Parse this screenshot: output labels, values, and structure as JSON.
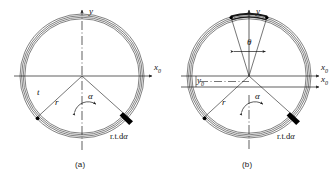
{
  "figure": {
    "type": "engineering-diagram",
    "panels": [
      {
        "id": "a",
        "caption": "(a)",
        "center": {
          "x": 82,
          "y": 76
        },
        "radius": 62,
        "wall_lines": 4,
        "wall_gap": 1.6,
        "labels": {
          "y_axis": "y",
          "x_axis": "x",
          "x_axis_sub": "0",
          "thickness": "t",
          "radius": "r",
          "angle_alpha": "α",
          "element": "r.t.d",
          "element_italic": "α"
        },
        "radial_lines": [
          {
            "angle_deg": 222,
            "name": "radius-line-left"
          },
          {
            "angle_deg": 318,
            "name": "radius-line-right"
          }
        ],
        "markers": [
          {
            "angle_deg": 222,
            "kind": "dot"
          },
          {
            "angle_deg": 318,
            "kind": "wedge"
          }
        ]
      },
      {
        "id": "b",
        "caption": "(b)",
        "center": {
          "x": 249,
          "y": 76
        },
        "radius": 62,
        "wall_lines": 4,
        "wall_gap": 1.6,
        "labels": {
          "y_axis": "y",
          "x_axis_upper": "x",
          "x_axis_upper_sub": "0",
          "x_axis_lower": "x",
          "x_axis_lower_sub": "0",
          "y_offset": "y",
          "y_offset_sub": "0",
          "radius": "r",
          "angle_alpha": "α",
          "angle_theta": "θ",
          "element": "r.t.d",
          "element_italic": "α"
        },
        "radial_lines": [
          {
            "angle_deg": 222,
            "name": "radius-line-left"
          },
          {
            "angle_deg": 318,
            "name": "radius-line-right"
          },
          {
            "angle_deg": 107,
            "name": "theta-line-left"
          },
          {
            "angle_deg": 73,
            "name": "theta-line-right"
          }
        ],
        "markers": [
          {
            "angle_deg": 222,
            "kind": "dot"
          },
          {
            "angle_deg": 318,
            "kind": "wedge"
          },
          {
            "angle_deg": 107,
            "kind": "dot"
          },
          {
            "angle_deg": 73,
            "kind": "dot"
          }
        ],
        "x_axis_offset": 11,
        "theta_arc_dark": true
      }
    ],
    "colors": {
      "stroke": "#1a1a1a",
      "fill_element": "#000000",
      "background": "#ffffff",
      "axis": "#1a1a1a"
    }
  }
}
